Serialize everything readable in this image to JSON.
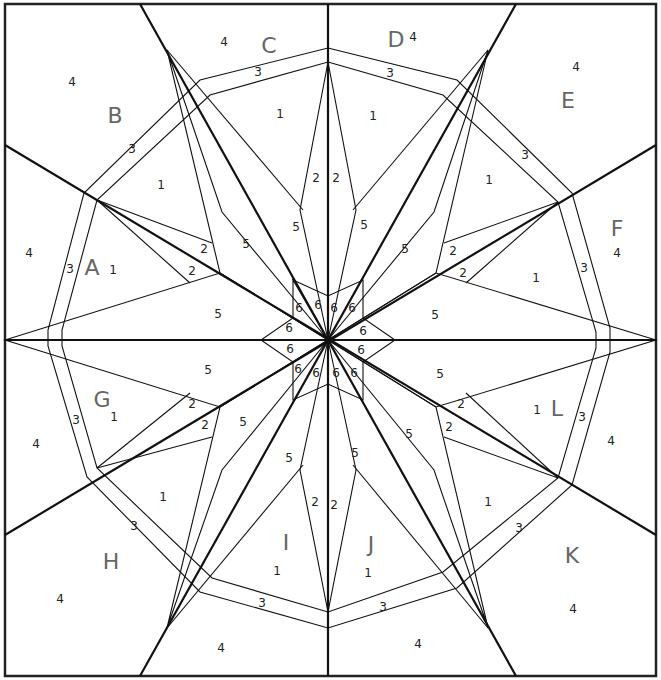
{
  "sections": [
    "A",
    "B",
    "C",
    "D",
    "E",
    "F",
    "G",
    "H",
    "I",
    "J",
    "K",
    "L"
  ],
  "section_labels": [
    {
      "t": "A",
      "x": 92,
      "y": 268
    },
    {
      "t": "B",
      "x": 115,
      "y": 116
    },
    {
      "t": "C",
      "x": 269,
      "y": 46
    },
    {
      "t": "D",
      "x": 396,
      "y": 40
    },
    {
      "t": "E",
      "x": 568,
      "y": 101
    },
    {
      "t": "F",
      "x": 617,
      "y": 229
    },
    {
      "t": "G",
      "x": 102,
      "y": 400
    },
    {
      "t": "H",
      "x": 111,
      "y": 562
    },
    {
      "t": "I",
      "x": 286,
      "y": 543
    },
    {
      "t": "J",
      "x": 371,
      "y": 545
    },
    {
      "t": "K",
      "x": 572,
      "y": 556
    },
    {
      "t": "L",
      "x": 557,
      "y": 409
    }
  ],
  "piece_labels": [
    {
      "t": "4",
      "x": 224,
      "y": 42
    },
    {
      "t": "4",
      "x": 72,
      "y": 82
    },
    {
      "t": "4",
      "x": 413,
      "y": 37
    },
    {
      "t": "4",
      "x": 576,
      "y": 67
    },
    {
      "t": "4",
      "x": 29,
      "y": 253
    },
    {
      "t": "4",
      "x": 617,
      "y": 253
    },
    {
      "t": "4",
      "x": 36,
      "y": 444
    },
    {
      "t": "4",
      "x": 611,
      "y": 441
    },
    {
      "t": "4",
      "x": 60,
      "y": 599
    },
    {
      "t": "4",
      "x": 221,
      "y": 648
    },
    {
      "t": "4",
      "x": 418,
      "y": 644
    },
    {
      "t": "4",
      "x": 573,
      "y": 609
    },
    {
      "t": "3",
      "x": 258,
      "y": 72
    },
    {
      "t": "3",
      "x": 390,
      "y": 73
    },
    {
      "t": "3",
      "x": 132,
      "y": 149
    },
    {
      "t": "3",
      "x": 525,
      "y": 155
    },
    {
      "t": "3",
      "x": 70,
      "y": 269
    },
    {
      "t": "3",
      "x": 584,
      "y": 268
    },
    {
      "t": "3",
      "x": 76,
      "y": 420
    },
    {
      "t": "3",
      "x": 582,
      "y": 417
    },
    {
      "t": "3",
      "x": 134,
      "y": 526
    },
    {
      "t": "3",
      "x": 519,
      "y": 528
    },
    {
      "t": "3",
      "x": 262,
      "y": 603
    },
    {
      "t": "3",
      "x": 383,
      "y": 607
    },
    {
      "t": "1",
      "x": 280,
      "y": 114
    },
    {
      "t": "1",
      "x": 373,
      "y": 116
    },
    {
      "t": "1",
      "x": 161,
      "y": 185
    },
    {
      "t": "1",
      "x": 489,
      "y": 180
    },
    {
      "t": "1",
      "x": 113,
      "y": 270
    },
    {
      "t": "1",
      "x": 536,
      "y": 278
    },
    {
      "t": "1",
      "x": 114,
      "y": 417
    },
    {
      "t": "1",
      "x": 537,
      "y": 410
    },
    {
      "t": "1",
      "x": 163,
      "y": 497
    },
    {
      "t": "1",
      "x": 488,
      "y": 502
    },
    {
      "t": "1",
      "x": 277,
      "y": 571
    },
    {
      "t": "1",
      "x": 368,
      "y": 573
    },
    {
      "t": "2",
      "x": 316,
      "y": 178
    },
    {
      "t": "2",
      "x": 336,
      "y": 178
    },
    {
      "t": "2",
      "x": 204,
      "y": 249
    },
    {
      "t": "2",
      "x": 453,
      "y": 251
    },
    {
      "t": "2",
      "x": 192,
      "y": 271
    },
    {
      "t": "2",
      "x": 463,
      "y": 273
    },
    {
      "t": "2",
      "x": 192,
      "y": 404
    },
    {
      "t": "2",
      "x": 461,
      "y": 404
    },
    {
      "t": "2",
      "x": 205,
      "y": 425
    },
    {
      "t": "2",
      "x": 449,
      "y": 427
    },
    {
      "t": "2",
      "x": 315,
      "y": 502
    },
    {
      "t": "2",
      "x": 334,
      "y": 505
    },
    {
      "t": "5",
      "x": 296,
      "y": 227
    },
    {
      "t": "5",
      "x": 364,
      "y": 225
    },
    {
      "t": "5",
      "x": 246,
      "y": 244
    },
    {
      "t": "5",
      "x": 405,
      "y": 249
    },
    {
      "t": "5",
      "x": 218,
      "y": 314
    },
    {
      "t": "5",
      "x": 435,
      "y": 315
    },
    {
      "t": "5",
      "x": 208,
      "y": 370
    },
    {
      "t": "5",
      "x": 440,
      "y": 374
    },
    {
      "t": "5",
      "x": 243,
      "y": 422
    },
    {
      "t": "5",
      "x": 409,
      "y": 434
    },
    {
      "t": "5",
      "x": 289,
      "y": 458
    },
    {
      "t": "5",
      "x": 355,
      "y": 453
    },
    {
      "t": "6",
      "x": 299,
      "y": 308
    },
    {
      "t": "6",
      "x": 318,
      "y": 305
    },
    {
      "t": "6",
      "x": 334,
      "y": 308
    },
    {
      "t": "6",
      "x": 352,
      "y": 308
    },
    {
      "t": "6",
      "x": 289,
      "y": 328
    },
    {
      "t": "6",
      "x": 363,
      "y": 331
    },
    {
      "t": "6",
      "x": 290,
      "y": 349
    },
    {
      "t": "6",
      "x": 361,
      "y": 350
    },
    {
      "t": "6",
      "x": 298,
      "y": 369
    },
    {
      "t": "6",
      "x": 316,
      "y": 373
    },
    {
      "t": "6",
      "x": 336,
      "y": 373
    },
    {
      "t": "6",
      "x": 354,
      "y": 373
    }
  ],
  "colors": {
    "line": "#111111",
    "label": "#222222",
    "section_label": "#666666",
    "background": "#ffffff"
  }
}
